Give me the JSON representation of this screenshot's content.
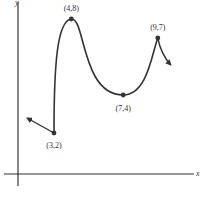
{
  "chart_data": {
    "type": "line",
    "title": "",
    "xlabel": "x",
    "ylabel": "y",
    "grid": false,
    "legend": "none",
    "points": [
      {
        "x": 3,
        "y": 2,
        "label": "(3,2)"
      },
      {
        "x": 4,
        "y": 8,
        "label": "(4,8)"
      },
      {
        "x": 7,
        "y": 4,
        "label": "(7,4)"
      },
      {
        "x": 9,
        "y": 7,
        "label": "(9,7)"
      }
    ],
    "end_behavior": {
      "left": "arrow continuing up-left from (3,2)",
      "right": "arrow continuing down-right from (9,7)"
    },
    "colors": {
      "curve": "#333333",
      "axes": "#333333"
    }
  }
}
